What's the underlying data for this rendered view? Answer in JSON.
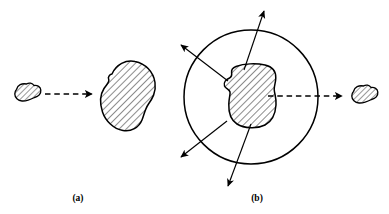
{
  "figure": {
    "caption_labels": {
      "panel_a": "(a)",
      "panel_b": "(b)"
    },
    "colors": {
      "stroke": "#000000",
      "hatch": "#000000",
      "background": "#ffffff",
      "fill": "#ffffff"
    },
    "canvas": {
      "width": 389,
      "height": 214
    },
    "panel_a": {
      "label": "(a)",
      "label_position": {
        "x": 78,
        "y": 198
      },
      "elements": {
        "small_blob": {
          "name": "small-hatched-blob",
          "center": {
            "x": 27,
            "y": 94
          },
          "width": 28,
          "height": 19,
          "hatched": true,
          "hatch_angle_deg": 45
        },
        "dashed_arrow": {
          "name": "dashed-arrow-right",
          "from": {
            "x": 45,
            "y": 94
          },
          "to": {
            "x": 97,
            "y": 94
          },
          "style": "dashed",
          "arrowhead": "right"
        },
        "large_blob": {
          "name": "large-hatched-blob",
          "center": {
            "x": 127,
            "y": 96
          },
          "width": 56,
          "height": 70,
          "hatched": true,
          "hatch_angle_deg": 45
        }
      }
    },
    "panel_b": {
      "label": "(b)",
      "label_position": {
        "x": 257,
        "y": 198
      },
      "elements": {
        "circle": {
          "name": "boundary-circle",
          "center": {
            "x": 251,
            "y": 97
          },
          "radius": 67
        },
        "inner_blob": {
          "name": "inner-hatched-blob",
          "center": {
            "x": 252,
            "y": 96
          },
          "width": 48,
          "height": 62,
          "hatched": true,
          "hatch_angle_deg": 45
        },
        "radial_arrows": [
          {
            "name": "radial-arrow-upper-left",
            "angle_deg": 145,
            "from_r": 28,
            "to_r": 92
          },
          {
            "name": "radial-arrow-upper-right",
            "angle_deg": 72,
            "from_r": 30,
            "to_r": 96
          },
          {
            "name": "radial-arrow-lower-left",
            "angle_deg": 208,
            "from_r": 28,
            "to_r": 92
          },
          {
            "name": "radial-arrow-lower-right",
            "angle_deg": 255,
            "from_r": 30,
            "to_r": 96
          }
        ],
        "dashed_arrow": {
          "name": "dashed-arrow-right",
          "from": {
            "x": 272,
            "y": 96
          },
          "to": {
            "x": 345,
            "y": 96
          },
          "style": "dashed",
          "arrowhead": "right"
        },
        "outer_blob": {
          "name": "outer-hatched-blob",
          "center": {
            "x": 364,
            "y": 96
          },
          "width": 28,
          "height": 19,
          "hatched": true,
          "hatch_angle_deg": 45
        }
      }
    }
  }
}
